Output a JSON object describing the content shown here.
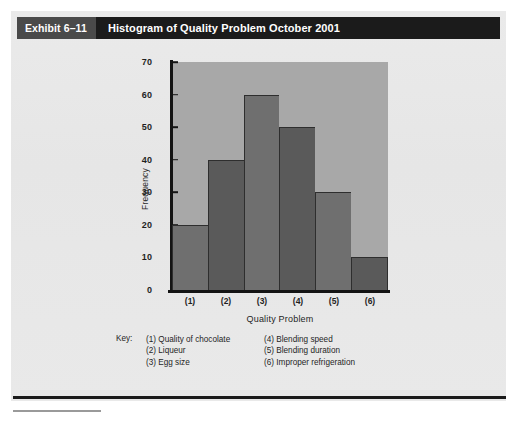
{
  "exhibit": {
    "number_label": "Exhibit 6–11",
    "title": "Histogram of Quality Problem October 2001"
  },
  "key": {
    "label": "Key:",
    "column_1": [
      "(1) Quality of chocolate",
      "(2) Liqueur",
      "(3) Egg size"
    ],
    "column_2": [
      "(4) Blending speed",
      "(5) Blending duration",
      "(6) Improper refrigeration"
    ]
  },
  "colors": {
    "header_dark": "#1b1b1b",
    "header_number": "#4a4a4a",
    "card_background": "#e8e8e8",
    "plot_background": "#a8a8a8",
    "bar_light": "#6f6f6f",
    "bar_dark": "#5a5a5a",
    "axis": "#141414"
  },
  "chart_data": {
    "type": "bar",
    "title": "Histogram of Quality Problem October 2001",
    "subtitle": "",
    "xlabel": "Quality Problem",
    "ylabel": "Frequency",
    "categories": [
      "(1)",
      "(2)",
      "(3)",
      "(4)",
      "(5)",
      "(6)"
    ],
    "category_names": [
      "Quality of chocolate",
      "Liqueur",
      "Egg size",
      "Blending speed",
      "Blending duration",
      "Improper refrigeration"
    ],
    "values": [
      20,
      40,
      60,
      50,
      30,
      10
    ],
    "ylim": [
      0,
      70
    ],
    "ytick_labels": [
      "0",
      "10",
      "20",
      "30",
      "40",
      "50",
      "60",
      "70"
    ],
    "ytick_values": [
      0,
      10,
      20,
      30,
      40,
      50,
      60,
      70
    ],
    "grid": false,
    "legend": "below-axis-key",
    "bars_contiguous": true
  }
}
